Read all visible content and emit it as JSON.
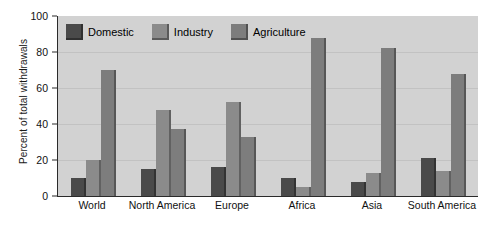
{
  "chart_data": {
    "type": "bar",
    "title": "",
    "xlabel": "",
    "ylabel": "Percent of total withdrawals",
    "ylim": [
      0,
      100
    ],
    "yticks": [
      0,
      20,
      40,
      60,
      80,
      100
    ],
    "grid": true,
    "legend_position": "top-left",
    "categories": [
      "World",
      "North America",
      "Europe",
      "Africa",
      "Asia",
      "South America"
    ],
    "series": [
      {
        "name": "Domestic",
        "color": "#4a4a4a",
        "values": [
          10,
          15,
          16,
          10,
          8,
          21
        ]
      },
      {
        "name": "Industry",
        "color": "#8b8b8b",
        "values": [
          20,
          48,
          52,
          5,
          13,
          14
        ]
      },
      {
        "name": "Agriculture",
        "color": "#7d7d7d",
        "values": [
          70,
          37,
          33,
          88,
          82,
          68
        ]
      }
    ]
  },
  "figure": {
    "background": "#ffffff",
    "plot_background": "#d2d2d2",
    "watermark": ""
  }
}
